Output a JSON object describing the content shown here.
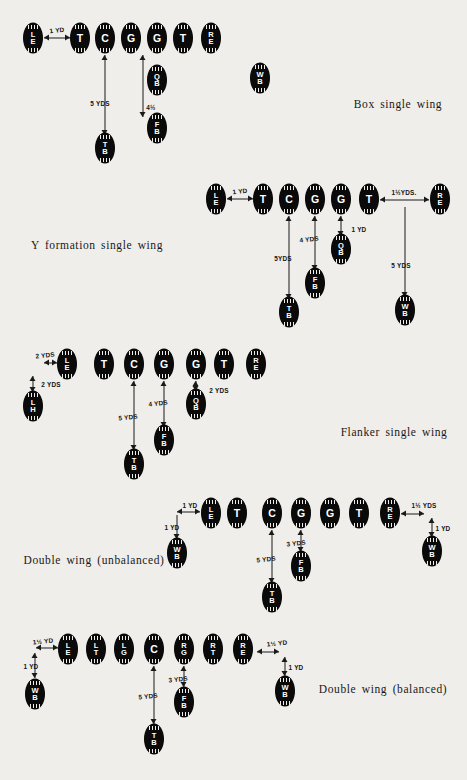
{
  "page": {
    "background": "#efeeea",
    "ink": "#0a0a0a"
  },
  "formations": [
    {
      "id": "box-single-wing",
      "caption": "Box single wing",
      "caption_pos": {
        "x": 398,
        "y": 104
      },
      "players": [
        {
          "name": "LE",
          "lines": [
            "L",
            "E"
          ],
          "x": 33,
          "y": 38
        },
        {
          "name": "T",
          "lines": [
            "T"
          ],
          "x": 80,
          "y": 38
        },
        {
          "name": "C",
          "lines": [
            "C"
          ],
          "x": 105,
          "y": 38
        },
        {
          "name": "G",
          "lines": [
            "G"
          ],
          "x": 131,
          "y": 38
        },
        {
          "name": "G",
          "lines": [
            "G"
          ],
          "x": 157,
          "y": 38
        },
        {
          "name": "T",
          "lines": [
            "T"
          ],
          "x": 183,
          "y": 38
        },
        {
          "name": "RE",
          "lines": [
            "R",
            "E"
          ],
          "x": 211,
          "y": 38
        },
        {
          "name": "QB",
          "lines": [
            "Q",
            "B"
          ],
          "x": 157,
          "y": 80
        },
        {
          "name": "WB",
          "lines": [
            "W",
            "B"
          ],
          "x": 260,
          "y": 78
        },
        {
          "name": "FB",
          "lines": [
            "F",
            "B"
          ],
          "x": 157,
          "y": 128
        },
        {
          "name": "TB",
          "lines": [
            "T",
            "B"
          ],
          "x": 105,
          "y": 148
        }
      ],
      "arrows": [
        {
          "dir": "h",
          "x1": 44,
          "x2": 70,
          "y": 38,
          "heads": "both"
        },
        {
          "dir": "v",
          "x": 105,
          "y1": 55,
          "y2": 135,
          "heads": "both"
        },
        {
          "dir": "v",
          "x": 143,
          "y1": 55,
          "y2": 117,
          "heads": "both"
        }
      ],
      "measures": [
        {
          "text": "1 YD",
          "x": 57,
          "y": 30,
          "rotated": true
        },
        {
          "text": "5 YDS",
          "x": 100,
          "y": 103,
          "rotated": false
        },
        {
          "text": "4½",
          "x": 151,
          "y": 107,
          "rotated": false
        }
      ]
    },
    {
      "id": "y-formation-single-wing",
      "caption": "Y formation single wing",
      "caption_pos": {
        "x": 97,
        "y": 245
      },
      "players": [
        {
          "name": "LE",
          "lines": [
            "L",
            "E"
          ],
          "x": 216,
          "y": 199
        },
        {
          "name": "T",
          "lines": [
            "T"
          ],
          "x": 263,
          "y": 199
        },
        {
          "name": "C",
          "lines": [
            "C"
          ],
          "x": 289,
          "y": 199
        },
        {
          "name": "G",
          "lines": [
            "G"
          ],
          "x": 315,
          "y": 199
        },
        {
          "name": "G",
          "lines": [
            "G"
          ],
          "x": 341,
          "y": 199
        },
        {
          "name": "T",
          "lines": [
            "T"
          ],
          "x": 369,
          "y": 199
        },
        {
          "name": "RE",
          "lines": [
            "R",
            "E"
          ],
          "x": 440,
          "y": 199
        },
        {
          "name": "QB",
          "lines": [
            "Q",
            "B"
          ],
          "x": 341,
          "y": 249
        },
        {
          "name": "FB",
          "lines": [
            "F",
            "B"
          ],
          "x": 315,
          "y": 283
        },
        {
          "name": "TB",
          "lines": [
            "T",
            "B"
          ],
          "x": 289,
          "y": 312
        },
        {
          "name": "WB",
          "lines": [
            "W",
            "B"
          ],
          "x": 405,
          "y": 310
        }
      ],
      "arrows": [
        {
          "dir": "h",
          "x1": 227,
          "x2": 253,
          "y": 199,
          "heads": "both"
        },
        {
          "dir": "v",
          "x": 289,
          "y1": 216,
          "y2": 299,
          "heads": "both"
        },
        {
          "dir": "v",
          "x": 315,
          "y1": 216,
          "y2": 270,
          "heads": "both"
        },
        {
          "dir": "v",
          "x": 341,
          "y1": 216,
          "y2": 236,
          "heads": "both"
        },
        {
          "dir": "h",
          "x1": 380,
          "x2": 429,
          "y": 200,
          "heads": "both"
        },
        {
          "dir": "v",
          "x": 405,
          "y1": 207,
          "y2": 297,
          "heads": "down"
        }
      ],
      "measures": [
        {
          "text": "1 YD",
          "x": 240,
          "y": 191,
          "rotated": true
        },
        {
          "text": "5YDS",
          "x": 283,
          "y": 258,
          "rotated": false
        },
        {
          "text": "4 YDS",
          "x": 309,
          "y": 239,
          "rotated": true
        },
        {
          "text": "1 YD",
          "x": 359,
          "y": 229,
          "rotated": false
        },
        {
          "text": "1½YDS.",
          "x": 404,
          "y": 192,
          "rotated": false
        },
        {
          "text": "5 YDS",
          "x": 401,
          "y": 265,
          "rotated": false
        }
      ]
    },
    {
      "id": "flanker-single-wing",
      "caption": "Flanker single wing",
      "caption_pos": {
        "x": 394,
        "y": 432
      },
      "players": [
        {
          "name": "LE",
          "lines": [
            "L",
            "E"
          ],
          "x": 67,
          "y": 364
        },
        {
          "name": "T",
          "lines": [
            "T"
          ],
          "x": 104,
          "y": 364
        },
        {
          "name": "C",
          "lines": [
            "C"
          ],
          "x": 134,
          "y": 364
        },
        {
          "name": "G",
          "lines": [
            "G"
          ],
          "x": 164,
          "y": 364
        },
        {
          "name": "G",
          "lines": [
            "G"
          ],
          "x": 196,
          "y": 364
        },
        {
          "name": "T",
          "lines": [
            "T"
          ],
          "x": 224,
          "y": 364
        },
        {
          "name": "RE",
          "lines": [
            "R",
            "E"
          ],
          "x": 256,
          "y": 364
        },
        {
          "name": "QB",
          "lines": [
            "Q",
            "B"
          ],
          "x": 196,
          "y": 404
        },
        {
          "name": "LH",
          "lines": [
            "L",
            "H"
          ],
          "x": 33,
          "y": 406
        },
        {
          "name": "FB",
          "lines": [
            "F",
            "B"
          ],
          "x": 164,
          "y": 440
        },
        {
          "name": "TB",
          "lines": [
            "T",
            "B"
          ],
          "x": 134,
          "y": 464
        }
      ],
      "arrows": [
        {
          "dir": "h",
          "x1": 44,
          "x2": 57,
          "y": 363,
          "heads": "both"
        },
        {
          "dir": "v",
          "x": 33,
          "y1": 376,
          "y2": 392,
          "heads": "both"
        },
        {
          "dir": "v",
          "x": 134,
          "y1": 381,
          "y2": 450,
          "heads": "both"
        },
        {
          "dir": "v",
          "x": 164,
          "y1": 381,
          "y2": 427,
          "heads": "both"
        },
        {
          "dir": "v",
          "x": 196,
          "y1": 381,
          "y2": 391,
          "heads": "both"
        }
      ],
      "measures": [
        {
          "text": "2 YDS",
          "x": 45,
          "y": 355,
          "rotated": true
        },
        {
          "text": "2 YDS",
          "x": 51,
          "y": 384,
          "rotated": false
        },
        {
          "text": "5 YDS",
          "x": 128,
          "y": 417,
          "rotated": true
        },
        {
          "text": "4 YDS",
          "x": 158,
          "y": 403,
          "rotated": true
        },
        {
          "text": "2 YDS",
          "x": 219,
          "y": 390,
          "rotated": false
        }
      ]
    },
    {
      "id": "double-wing-unbalanced",
      "caption": "Double wing (unbalanced)",
      "caption_pos": {
        "x": 94,
        "y": 560
      },
      "players": [
        {
          "name": "LE",
          "lines": [
            "L",
            "E"
          ],
          "x": 211,
          "y": 513
        },
        {
          "name": "T",
          "lines": [
            "T"
          ],
          "x": 237,
          "y": 513
        },
        {
          "name": "C",
          "lines": [
            "C"
          ],
          "x": 272,
          "y": 513
        },
        {
          "name": "G",
          "lines": [
            "G"
          ],
          "x": 301,
          "y": 513
        },
        {
          "name": "G",
          "lines": [
            "G"
          ],
          "x": 330,
          "y": 513
        },
        {
          "name": "T",
          "lines": [
            "T"
          ],
          "x": 359,
          "y": 513
        },
        {
          "name": "RE",
          "lines": [
            "R",
            "E"
          ],
          "x": 390,
          "y": 513
        },
        {
          "name": "WB",
          "lines": [
            "W",
            "B"
          ],
          "x": 177,
          "y": 553
        },
        {
          "name": "WB",
          "lines": [
            "W",
            "B"
          ],
          "x": 432,
          "y": 551
        },
        {
          "name": "FB",
          "lines": [
            "F",
            "B"
          ],
          "x": 301,
          "y": 566
        },
        {
          "name": "TB",
          "lines": [
            "T",
            "B"
          ],
          "x": 272,
          "y": 597
        }
      ],
      "arrows": [
        {
          "dir": "h",
          "x1": 177,
          "x2": 200,
          "y": 512,
          "heads": "both"
        },
        {
          "dir": "v",
          "x": 177,
          "y1": 515,
          "y2": 539,
          "heads": "down"
        },
        {
          "dir": "v",
          "x": 272,
          "y1": 530,
          "y2": 583,
          "heads": "both"
        },
        {
          "dir": "v",
          "x": 301,
          "y1": 530,
          "y2": 552,
          "heads": "both"
        },
        {
          "dir": "h",
          "x1": 401,
          "x2": 424,
          "y": 514,
          "heads": "both"
        },
        {
          "dir": "v",
          "x": 432,
          "y1": 518,
          "y2": 537,
          "heads": "both"
        }
      ],
      "measures": [
        {
          "text": "1 YD",
          "x": 190,
          "y": 505,
          "rotated": false
        },
        {
          "text": "1 YD",
          "x": 172,
          "y": 527,
          "rotated": false
        },
        {
          "text": "5 YDS",
          "x": 266,
          "y": 559,
          "rotated": true
        },
        {
          "text": "3 YDS",
          "x": 296,
          "y": 543,
          "rotated": true
        },
        {
          "text": "1½ YDS",
          "x": 424,
          "y": 505,
          "rotated": false
        },
        {
          "text": "1 YD",
          "x": 443,
          "y": 528,
          "rotated": false
        }
      ]
    },
    {
      "id": "double-wing-balanced",
      "caption": "Double wing (balanced)",
      "caption_pos": {
        "x": 383,
        "y": 689
      },
      "players": [
        {
          "name": "LE",
          "lines": [
            "L",
            "E"
          ],
          "x": 68,
          "y": 649
        },
        {
          "name": "LT",
          "lines": [
            "L",
            "T"
          ],
          "x": 96,
          "y": 649
        },
        {
          "name": "LG",
          "lines": [
            "L",
            "G"
          ],
          "x": 124,
          "y": 649
        },
        {
          "name": "C",
          "lines": [
            "C"
          ],
          "x": 154,
          "y": 649
        },
        {
          "name": "RG",
          "lines": [
            "R",
            "G"
          ],
          "x": 184,
          "y": 649
        },
        {
          "name": "RT",
          "lines": [
            "R",
            "T"
          ],
          "x": 213,
          "y": 649
        },
        {
          "name": "RE",
          "lines": [
            "R",
            "E"
          ],
          "x": 243,
          "y": 649
        },
        {
          "name": "WB",
          "lines": [
            "W",
            "B"
          ],
          "x": 35,
          "y": 694
        },
        {
          "name": "WB",
          "lines": [
            "W",
            "B"
          ],
          "x": 285,
          "y": 691
        },
        {
          "name": "FB",
          "lines": [
            "F",
            "B"
          ],
          "x": 184,
          "y": 702
        },
        {
          "name": "TB",
          "lines": [
            "T",
            "B"
          ],
          "x": 154,
          "y": 739
        }
      ],
      "arrows": [
        {
          "dir": "h",
          "x1": 36,
          "x2": 58,
          "y": 648,
          "heads": "both"
        },
        {
          "dir": "v",
          "x": 35,
          "y1": 653,
          "y2": 678,
          "heads": "both"
        },
        {
          "dir": "v",
          "x": 154,
          "y1": 666,
          "y2": 724,
          "heads": "both"
        },
        {
          "dir": "v",
          "x": 184,
          "y1": 666,
          "y2": 687,
          "heads": "both"
        },
        {
          "dir": "h",
          "x1": 257,
          "x2": 279,
          "y": 652,
          "heads": "both"
        },
        {
          "dir": "v",
          "x": 285,
          "y1": 657,
          "y2": 676,
          "heads": "both"
        }
      ],
      "measures": [
        {
          "text": "1½ YD",
          "x": 43,
          "y": 641,
          "rotated": true
        },
        {
          "text": "1 YD",
          "x": 31,
          "y": 666,
          "rotated": false
        },
        {
          "text": "5 YDS",
          "x": 148,
          "y": 696,
          "rotated": true
        },
        {
          "text": "3 YDS",
          "x": 178,
          "y": 679,
          "rotated": true
        },
        {
          "text": "1½ YD",
          "x": 277,
          "y": 643,
          "rotated": true
        },
        {
          "text": "1 YD",
          "x": 296,
          "y": 667,
          "rotated": false
        }
      ]
    }
  ]
}
